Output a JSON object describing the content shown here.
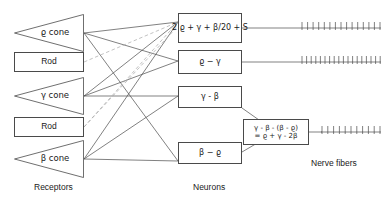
{
  "diagram": {
    "title_labels": {
      "receptors": "Receptors",
      "neurons": "Neurons",
      "nerve_fibers": "Nerve fibers"
    },
    "colors": {
      "stroke": "#4a4a4a",
      "dashed_stroke": "#a8a8a8",
      "text": "#1a1a1a",
      "background": "#ffffff"
    },
    "receptors": [
      {
        "label": "ϱ cone",
        "type": "cone"
      },
      {
        "label": "Rod",
        "type": "box"
      },
      {
        "label": "γ cone",
        "type": "cone"
      },
      {
        "label": "Rod",
        "type": "box"
      },
      {
        "label": "β cone",
        "type": "cone"
      }
    ],
    "neurons": [
      {
        "line1": "2 ϱ + γ + β/20 + S",
        "line2": ""
      },
      {
        "line1": "ϱ − γ",
        "line2": ""
      },
      {
        "line1": "γ - β",
        "line2": ""
      },
      {
        "line1": "γ - β - (β - ϱ)",
        "line2": "= ϱ + γ - 2β"
      },
      {
        "line1": "β − ϱ",
        "line2": ""
      }
    ],
    "nerve_fiber_bundles": [
      {
        "ticks": 15
      },
      {
        "ticks": 18
      },
      {
        "ticks": 0
      },
      {
        "ticks": 11
      },
      {
        "ticks": 0
      }
    ]
  }
}
